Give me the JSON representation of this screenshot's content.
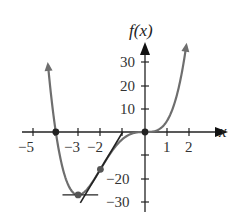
{
  "chart_data": {
    "type": "line",
    "title": "",
    "xlabel": "x",
    "ylabel": "f(x)",
    "function": "f(x) = x^4 + 4x^3",
    "x_ticks": [
      -5,
      -4,
      -3,
      -2,
      -1,
      0,
      1,
      2
    ],
    "x_tick_labels": [
      "-5",
      "-3",
      "-2",
      "1",
      "2"
    ],
    "y_ticks": [
      30,
      20,
      10,
      -10,
      -20,
      -30
    ],
    "y_tick_labels": [
      "30",
      "20",
      "10",
      "-20",
      "-30"
    ],
    "xlim": [
      -5.5,
      2.6
    ],
    "ylim": [
      -33,
      42
    ],
    "grid": false,
    "series": [
      {
        "name": "f(x)",
        "color": "#6e6e6e",
        "x": [
          -4.35,
          -4,
          -3.5,
          -3,
          -2.5,
          -2,
          -1.5,
          -1,
          -0.5,
          0,
          0.5,
          1,
          1.5,
          1.85
        ],
        "values": [
          25.0,
          0,
          -21.4,
          -27,
          -23.4,
          -16,
          -8.4,
          -3,
          -0.44,
          0,
          0.56,
          5,
          18.6,
          37.1
        ]
      }
    ],
    "marked_points": [
      {
        "x": -4,
        "y": 0,
        "label": "root"
      },
      {
        "x": -3,
        "y": -27,
        "label": "minimum"
      },
      {
        "x": -2,
        "y": -16,
        "label": "inflection point"
      },
      {
        "x": 0,
        "y": 0,
        "label": "root / inflection point"
      }
    ],
    "tangent_lines": [
      {
        "at_x": -3,
        "slope": 0,
        "x_range": [
          -3.7,
          -2.1
        ]
      },
      {
        "at_x": -2,
        "slope": 16,
        "x_range": [
          -2.9,
          -1.0
        ]
      }
    ]
  },
  "labels": {
    "x_axis": "x",
    "y_axis": "f(x)",
    "xt_m5": "−5",
    "xt_m3": "−3",
    "xt_m2": "−2",
    "xt_1": "1",
    "xt_2": "2",
    "yt_30": "30",
    "yt_20": "20",
    "yt_10": "10",
    "yt_m20": "−20",
    "yt_m30": "−30"
  }
}
